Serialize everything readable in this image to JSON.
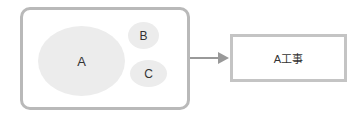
{
  "diagram": {
    "container": {
      "nodes": [
        {
          "id": "A",
          "label": "A"
        },
        {
          "id": "B",
          "label": "B"
        },
        {
          "id": "C",
          "label": "C"
        }
      ]
    },
    "arrow": {
      "from": "container",
      "to": "target"
    },
    "target": {
      "label": "A工事"
    },
    "colors": {
      "border": "#b9b9b9",
      "ellipse_fill": "#ececec",
      "arrow": "#999999",
      "text": "#333333"
    }
  }
}
